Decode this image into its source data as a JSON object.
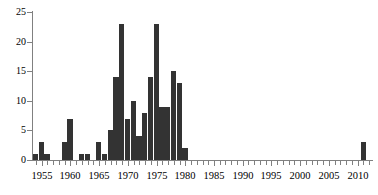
{
  "chart_data": {
    "type": "bar",
    "title": "",
    "subtitle": "",
    "xlabel": "",
    "ylabel": "",
    "xlim": [
      1953.5,
      2012.5
    ],
    "ylim": [
      0,
      25
    ],
    "grid": false,
    "legend": null,
    "bar_color": "#333333",
    "axis_color": "#808080",
    "background": "#ffffff",
    "ytick_labels": [
      "0",
      "5",
      "10",
      "15",
      "20",
      "25"
    ],
    "ytick_values": [
      0,
      5,
      10,
      15,
      20,
      25
    ],
    "xtick_labels": [
      "1955",
      "1960",
      "1965",
      "1970",
      "1975",
      "1980",
      "1985",
      "1990",
      "1995",
      "2000",
      "2005",
      "2010"
    ],
    "xtick_values": [
      1955,
      1960,
      1965,
      1970,
      1975,
      1980,
      1985,
      1990,
      1995,
      2000,
      2005,
      2010
    ],
    "categories": [
      1954,
      1955,
      1956,
      1957,
      1958,
      1959,
      1960,
      1961,
      1962,
      1963,
      1964,
      1965,
      1966,
      1967,
      1968,
      1969,
      1970,
      1971,
      1972,
      1973,
      1974,
      1975,
      1976,
      1977,
      1978,
      1979,
      1980,
      1981,
      1982,
      1983,
      1984,
      1985,
      1986,
      1987,
      1988,
      1989,
      1990,
      1991,
      1992,
      1993,
      1994,
      1995,
      1996,
      1997,
      1998,
      1999,
      2000,
      2001,
      2002,
      2003,
      2004,
      2005,
      2006,
      2007,
      2008,
      2009,
      2010,
      2011
    ],
    "values": [
      1,
      3,
      1,
      0,
      0,
      3,
      7,
      0,
      1,
      1,
      0,
      3,
      1,
      5,
      14,
      23,
      7,
      10,
      4,
      8,
      14,
      23,
      9,
      9,
      15,
      13,
      2,
      0,
      0,
      0,
      0,
      0,
      0,
      0,
      0,
      0,
      0,
      0,
      0,
      0,
      0,
      0,
      0,
      0,
      0,
      0,
      0,
      0,
      0,
      0,
      0,
      0,
      0,
      0,
      0,
      0,
      0,
      3
    ]
  }
}
